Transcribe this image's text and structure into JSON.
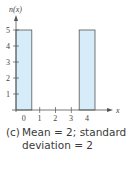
{
  "chart_data": {
    "type": "bar",
    "title": "",
    "xlabel": "x",
    "ylabel": "n(x)",
    "categories": [
      "0",
      "1",
      "2",
      "3",
      "4"
    ],
    "values": [
      5,
      0,
      0,
      0,
      5
    ],
    "x_ticks": [
      "0",
      "1",
      "2",
      "3",
      "4"
    ],
    "y_ticks": [
      "1",
      "2",
      "3",
      "4",
      "5"
    ],
    "ylim": [
      0,
      5
    ],
    "grid": false,
    "bar_fill": "#d6ecf8",
    "bar_stroke": "#555555"
  },
  "caption": {
    "label": "(c)",
    "line1": "Mean = 2; standard",
    "line2": "deviation = 2"
  }
}
